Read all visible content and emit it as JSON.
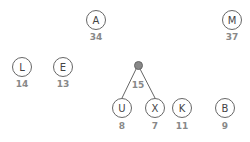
{
  "nodes": [
    {
      "id": "A",
      "label": "A",
      "value": "34",
      "x": 96,
      "y": 20
    },
    {
      "id": "M",
      "label": "M",
      "value": "37",
      "x": 232,
      "y": 20
    },
    {
      "id": "L",
      "label": "L",
      "value": "14",
      "x": 22,
      "y": 67
    },
    {
      "id": "E",
      "label": "E",
      "value": "13",
      "x": 63,
      "y": 67
    },
    {
      "id": "U",
      "label": "U",
      "value": "8",
      "x": 122,
      "y": 108
    },
    {
      "id": "X",
      "label": "X",
      "value": "7",
      "x": 155,
      "y": 108
    },
    {
      "id": "K",
      "label": "K",
      "value": "11",
      "x": 182,
      "y": 108
    },
    {
      "id": "B",
      "label": "B",
      "value": "9",
      "x": 225,
      "y": 108
    }
  ],
  "junction": {
    "value": "15",
    "x": 138,
    "y": 65,
    "children": [
      "U",
      "X"
    ]
  },
  "colors": {
    "edge": "#666666",
    "junction": "#888888",
    "value_text": "#888888"
  }
}
